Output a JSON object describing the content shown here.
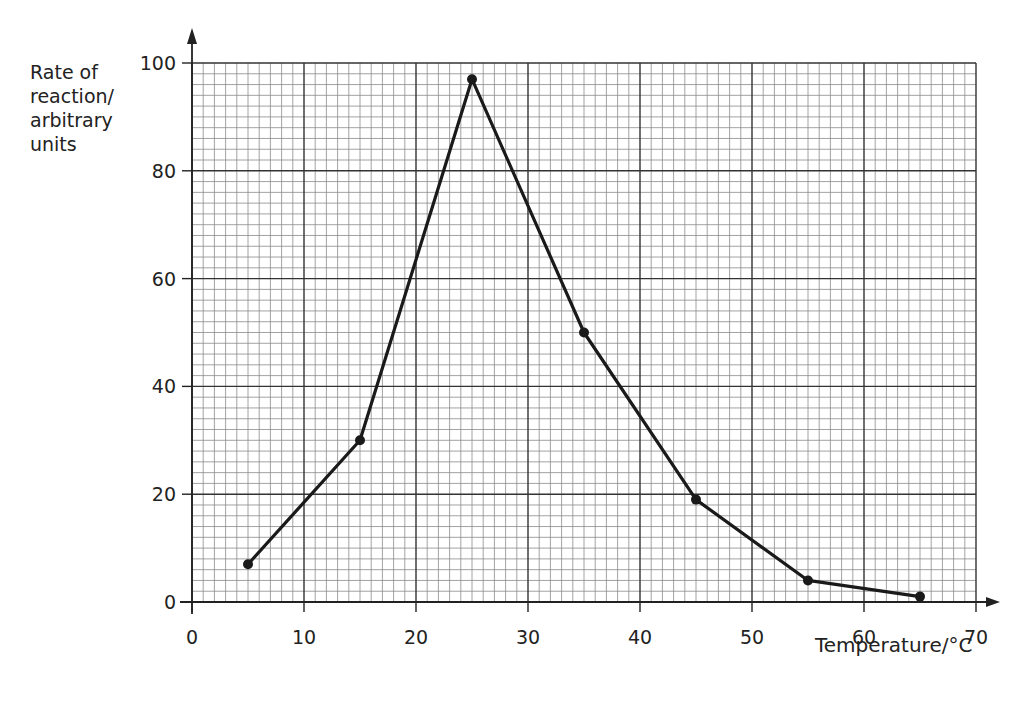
{
  "chart_data": {
    "type": "line",
    "title": "",
    "xlabel": "Temperature/°C",
    "ylabel": "Rate of reaction/ arbitrary units",
    "ylabel_lines": [
      "Rate of",
      "reaction/",
      "arbitrary",
      "units"
    ],
    "x": [
      5,
      15,
      25,
      35,
      45,
      55,
      65
    ],
    "series": [
      {
        "name": "Rate of reaction",
        "values": [
          7,
          30,
          97,
          50,
          19,
          4,
          1
        ]
      }
    ],
    "xlim": [
      0,
      70
    ],
    "ylim": [
      0,
      100
    ],
    "xticks": [
      "0",
      "10",
      "20",
      "30",
      "40",
      "50",
      "60",
      "70"
    ],
    "yticks": [
      "0",
      "20",
      "40",
      "60",
      "80",
      "100"
    ],
    "grid": true,
    "grid_style": "graph paper: major lines every 10 (x) / 20 (y), minor lines every 1 (x) / 2 (y)",
    "legend": null,
    "markers": "filled circles",
    "colors": {
      "line": "#1a1a1a",
      "grid_major": "#333333",
      "grid_minor": "#8a8a8a",
      "background": "#ffffff"
    }
  }
}
